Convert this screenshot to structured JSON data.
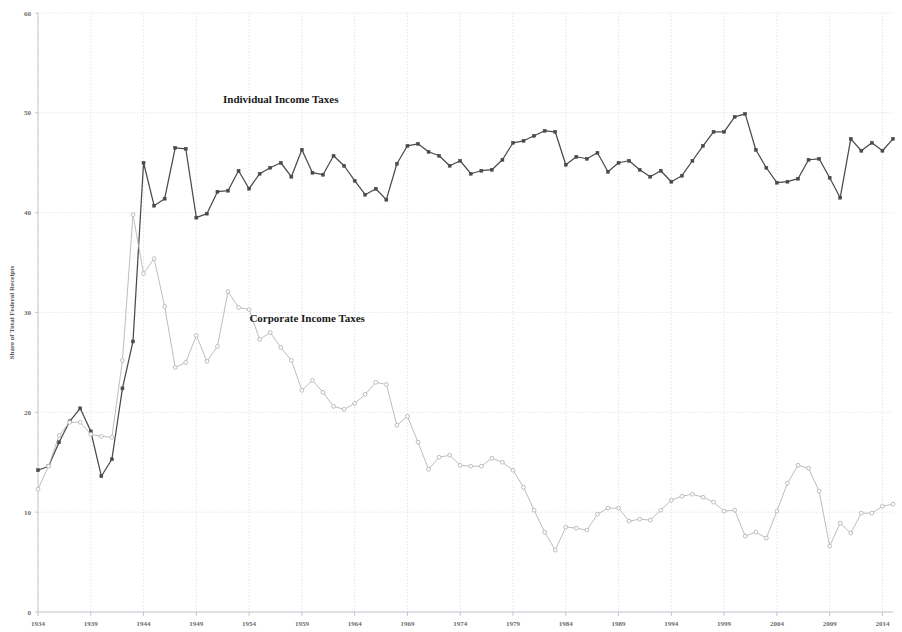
{
  "chart_data": {
    "type": "line",
    "title": "",
    "xlabel": "",
    "ylabel": "Share of Total Federal Receipts",
    "xlim": [
      1934,
      2015
    ],
    "ylim": [
      0,
      60
    ],
    "ytick_labels": [
      "0",
      "10",
      "20",
      "30",
      "40",
      "50",
      "60"
    ],
    "ytick_values": [
      0,
      10,
      20,
      30,
      40,
      50,
      60
    ],
    "xtick_labels": [
      "1934",
      "1939",
      "1944",
      "1949",
      "1954",
      "1959",
      "1964",
      "1969",
      "1974",
      "1979",
      "1984",
      "1989",
      "1994",
      "1999",
      "2004",
      "2009",
      "2014"
    ],
    "xtick_values": [
      1934,
      1939,
      1944,
      1949,
      1954,
      1959,
      1964,
      1969,
      1974,
      1979,
      1984,
      1989,
      1994,
      1999,
      2004,
      2009,
      2014
    ],
    "grid": true,
    "legend_position": "inline-annotation",
    "colors": {
      "individual": "#4a4a4a",
      "corporate": "#b5b5b5",
      "grid": "#d8d8e4",
      "axis": "#b9b9c4",
      "text": "#6d6d6d",
      "label_text": "#1a1a1a"
    },
    "annotations": [
      {
        "text": "Individual Income Taxes",
        "x": 1957.0,
        "y": 51.0
      },
      {
        "text": "Corporate Income Taxes",
        "x": 1959.5,
        "y": 29.0
      }
    ],
    "x": [
      1934,
      1935,
      1936,
      1937,
      1938,
      1939,
      1940,
      1941,
      1942,
      1943,
      1944,
      1945,
      1946,
      1947,
      1948,
      1949,
      1950,
      1951,
      1952,
      1953,
      1954,
      1955,
      1956,
      1957,
      1958,
      1959,
      1960,
      1961,
      1962,
      1963,
      1964,
      1965,
      1966,
      1967,
      1968,
      1969,
      1970,
      1971,
      1972,
      1973,
      1974,
      1975,
      1976,
      1977,
      1978,
      1979,
      1980,
      1981,
      1982,
      1983,
      1984,
      1985,
      1986,
      1987,
      1988,
      1989,
      1990,
      1991,
      1992,
      1993,
      1994,
      1995,
      1996,
      1997,
      1998,
      1999,
      2000,
      2001,
      2002,
      2003,
      2004,
      2005,
      2006,
      2007,
      2008,
      2009,
      2010,
      2011,
      2012,
      2013,
      2014,
      2015
    ],
    "series": [
      {
        "name": "Individual Income Taxes",
        "color": "#4a4a4a",
        "values": [
          14.2,
          14.6,
          17.0,
          19.1,
          20.4,
          18.1,
          13.6,
          15.3,
          22.4,
          27.1,
          45.0,
          40.7,
          41.4,
          46.5,
          46.4,
          39.5,
          39.9,
          42.1,
          42.2,
          44.2,
          42.4,
          43.9,
          44.5,
          45.0,
          43.6,
          46.3,
          44.0,
          43.8,
          45.7,
          44.7,
          43.2,
          41.8,
          42.4,
          41.3,
          44.9,
          46.7,
          46.9,
          46.1,
          45.7,
          44.7,
          45.2,
          43.9,
          44.2,
          44.3,
          45.3,
          47.0,
          47.2,
          47.7,
          48.2,
          48.1,
          44.8,
          45.6,
          45.4,
          46.0,
          44.1,
          45.0,
          45.2,
          44.3,
          43.6,
          44.2,
          43.1,
          43.7,
          45.2,
          46.7,
          48.1,
          48.1,
          49.6,
          49.9,
          46.3,
          44.5,
          43.0,
          43.1,
          43.4,
          45.3,
          45.4,
          43.5,
          41.5,
          47.4,
          46.2,
          47.0,
          46.2,
          47.4
        ]
      },
      {
        "name": "Corporate Income Taxes",
        "color": "#b5b5b5",
        "values": [
          12.3,
          14.6,
          17.7,
          19.0,
          19.0,
          17.8,
          17.6,
          17.5,
          25.2,
          39.8,
          33.9,
          35.4,
          30.6,
          24.5,
          25.0,
          27.7,
          25.1,
          26.6,
          32.1,
          30.5,
          30.3,
          27.3,
          28.0,
          26.5,
          25.2,
          22.2,
          23.2,
          22.0,
          20.6,
          20.3,
          20.9,
          21.8,
          23.0,
          22.8,
          18.7,
          19.6,
          17.0,
          14.3,
          15.5,
          15.7,
          14.7,
          14.6,
          14.6,
          15.4,
          15.0,
          14.2,
          12.5,
          10.2,
          8.0,
          6.2,
          8.5,
          8.4,
          8.2,
          9.8,
          10.4,
          10.4,
          9.1,
          9.3,
          9.2,
          10.2,
          11.2,
          11.6,
          11.8,
          11.5,
          11.0,
          10.1,
          10.2,
          7.6,
          8.0,
          7.4,
          10.1,
          12.9,
          14.7,
          14.4,
          12.1,
          6.6,
          8.9,
          7.9,
          9.9,
          9.9,
          10.6,
          10.8
        ]
      }
    ]
  },
  "figure": {
    "background_color": "#ffffff",
    "y_axis_title": "Share of Total Federal Receipts"
  }
}
